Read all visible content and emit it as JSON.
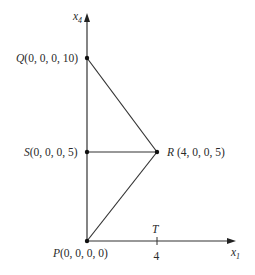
{
  "diagram": {
    "axes": {
      "vertical": {
        "label_var": "x",
        "label_sub": "4"
      },
      "horizontal": {
        "label_var": "x",
        "label_sub": "1"
      }
    },
    "points": {
      "Q": {
        "name": "Q",
        "coords": "(0, 0, 0, 10)"
      },
      "S": {
        "name": "S",
        "coords": "(0, 0, 0, 5)"
      },
      "R": {
        "name": "R",
        "coords": " (4, 0, 0, 5)"
      },
      "P": {
        "name": "P",
        "coords": "(0, 0, 0, 0)"
      },
      "T": {
        "name": "T"
      }
    },
    "tick": {
      "value": "4"
    },
    "edges": [
      [
        "P",
        "Q"
      ],
      [
        "Q",
        "R"
      ],
      [
        "S",
        "R"
      ],
      [
        "P",
        "R"
      ]
    ],
    "colors": {
      "line": "#333333",
      "point": "#111111",
      "text": "#2a2a2a"
    }
  }
}
